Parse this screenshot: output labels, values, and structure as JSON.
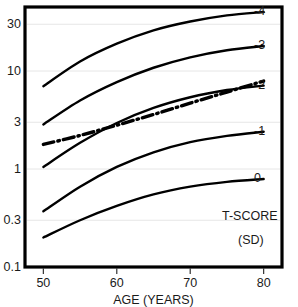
{
  "chart_data": {
    "type": "line",
    "title": "",
    "xlabel": "AGE  (YEARS)",
    "ylabel": "",
    "xlim": [
      47.5,
      82.5
    ],
    "ylim": [
      0.1,
      45
    ],
    "yscale": "log",
    "xscale": "linear",
    "grid": true,
    "grid_axis": "y",
    "legend_position": "right",
    "legend_title": "T-SCORE",
    "legend_subtitle": "(SD)",
    "xticks": [
      50,
      60,
      70,
      80
    ],
    "xtick_labels": [
      "50",
      "60",
      "70",
      "80"
    ],
    "yticks": [
      0.1,
      0.3,
      1,
      3,
      10,
      30
    ],
    "ytick_labels": [
      "0.1",
      "0.3",
      "1",
      "3",
      "10",
      "30"
    ],
    "x": [
      50,
      55,
      60,
      65,
      70,
      75,
      80
    ],
    "series": [
      {
        "name": "-4",
        "label": "-4",
        "style": "solid",
        "color": "#000000",
        "values": [
          7.0,
          12.5,
          19.0,
          26.0,
          32.0,
          37.0,
          40.0
        ]
      },
      {
        "name": "-3",
        "label": "-3",
        "style": "solid",
        "color": "#000000",
        "values": [
          2.85,
          5.0,
          7.7,
          10.8,
          13.8,
          16.3,
          18.0
        ]
      },
      {
        "name": "-2",
        "label": "-2",
        "style": "solid",
        "color": "#000000",
        "values": [
          1.05,
          1.85,
          2.95,
          4.2,
          5.4,
          6.4,
          7.1
        ]
      },
      {
        "name": "-1",
        "label": "-1",
        "style": "solid",
        "color": "#000000",
        "values": [
          0.37,
          0.66,
          1.05,
          1.48,
          1.88,
          2.18,
          2.4
        ]
      },
      {
        "name": "0",
        "label": "0",
        "style": "solid",
        "color": "#000000",
        "values": [
          0.2,
          0.3,
          0.42,
          0.55,
          0.66,
          0.74,
          0.79
        ]
      },
      {
        "name": "reference",
        "label": "",
        "style": "dash-dot",
        "color": "#000000",
        "values": [
          1.78,
          2.2,
          2.8,
          3.6,
          4.7,
          6.1,
          7.9
        ]
      }
    ],
    "tscore_labels": [
      {
        "text": "-4",
        "value": -4
      },
      {
        "text": "-3",
        "value": -3
      },
      {
        "text": "-2",
        "value": -2
      },
      {
        "text": "-1",
        "value": -1
      },
      {
        "text": "0",
        "value": 0
      }
    ]
  }
}
